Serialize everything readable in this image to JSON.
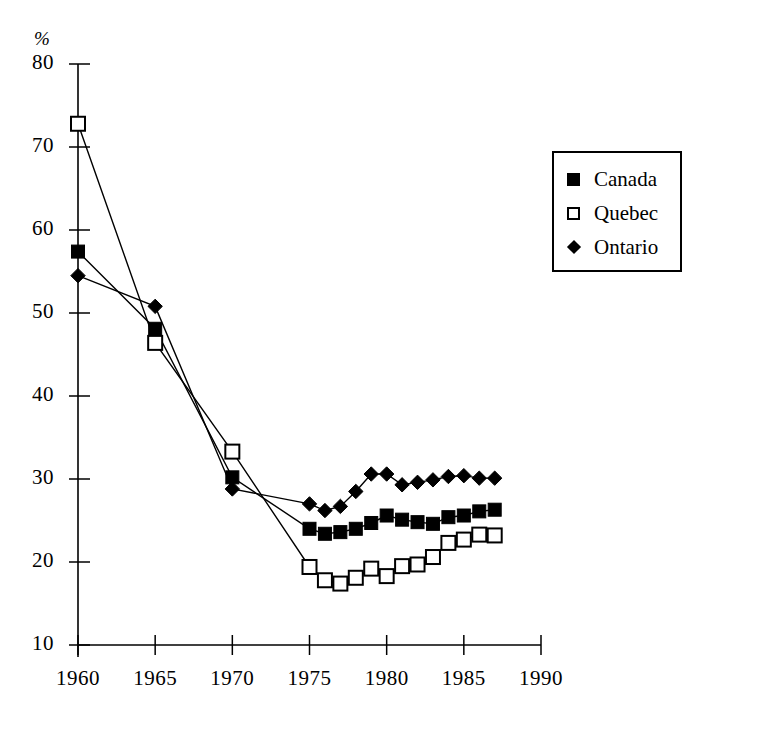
{
  "chart_data": {
    "type": "line",
    "title": "",
    "xlabel": "",
    "ylabel": "%",
    "unit_label": "%",
    "xlim": [
      1958.5,
      1990.5
    ],
    "ylim": [
      10,
      80
    ],
    "grid": false,
    "legend_position": "upper-right",
    "x": [
      1960,
      1965,
      1970,
      1975,
      1976,
      1977,
      1978,
      1979,
      1980,
      1981,
      1982,
      1983,
      1984,
      1985,
      1986,
      1987
    ],
    "series": [
      {
        "name": "Canada",
        "marker": "filled-square",
        "values": [
          57.4,
          48.1,
          30.2,
          24.0,
          23.4,
          23.6,
          24.0,
          24.7,
          25.6,
          25.1,
          24.8,
          24.6,
          25.4,
          25.6,
          26.1,
          26.3
        ]
      },
      {
        "name": "Quebec",
        "marker": "open-square",
        "values": [
          72.8,
          46.4,
          33.3,
          19.4,
          17.8,
          17.4,
          18.1,
          19.2,
          18.3,
          19.5,
          19.7,
          20.6,
          22.3,
          22.7,
          23.3,
          23.2
        ]
      },
      {
        "name": "Ontario",
        "marker": "filled-diamond",
        "values": [
          54.5,
          50.8,
          28.8,
          27.0,
          26.2,
          26.7,
          28.5,
          30.6,
          30.6,
          29.3,
          29.6,
          29.9,
          30.3,
          30.4,
          30.1,
          30.1
        ]
      }
    ],
    "yticks": [
      10,
      20,
      30,
      40,
      50,
      60,
      70,
      80
    ],
    "ytick_labels": [
      "10",
      "20",
      "30",
      "40",
      "50",
      "60",
      "70",
      "80"
    ],
    "xticks": [
      1960,
      1965,
      1970,
      1975,
      1980,
      1985,
      1990
    ],
    "xtick_labels": [
      "1960",
      "1965",
      "1970",
      "1975",
      "1980",
      "1985",
      "1990"
    ]
  },
  "legend": {
    "items": [
      {
        "label": "Canada",
        "marker": "filled-square"
      },
      {
        "label": "Quebec",
        "marker": "open-square"
      },
      {
        "label": "Ontario",
        "marker": "filled-diamond"
      }
    ]
  },
  "colors": {
    "ink": "#000000",
    "paper": "#ffffff"
  }
}
